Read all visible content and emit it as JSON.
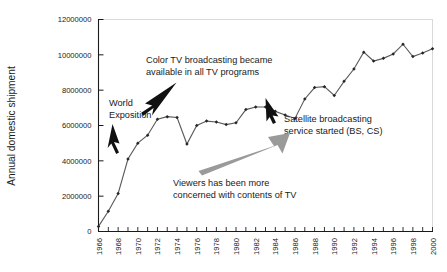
{
  "chart_data": {
    "type": "line",
    "title": "",
    "subtitle": "",
    "xlabel": "",
    "ylabel": "Annual domestic shipment",
    "xlim": [
      1966,
      2000
    ],
    "ylim": [
      0,
      12000000
    ],
    "grid": false,
    "legend": "none",
    "y_ticks": [
      "0",
      "2000000",
      "4000000",
      "6000000",
      "8000000",
      "10000000",
      "12000000"
    ],
    "y_tick_values": [
      0,
      2000000,
      4000000,
      6000000,
      8000000,
      10000000,
      12000000
    ],
    "x_ticks": [
      "1966",
      "1968",
      "1970",
      "1972",
      "1974",
      "1976",
      "1978",
      "1980",
      "1982",
      "1984",
      "1986",
      "1988",
      "1990",
      "1992",
      "1994",
      "1996",
      "1998",
      "2000"
    ],
    "x_tick_values": [
      1966,
      1968,
      1970,
      1972,
      1974,
      1976,
      1978,
      1980,
      1982,
      1984,
      1986,
      1988,
      1990,
      1992,
      1994,
      1996,
      1998,
      2000
    ],
    "x": [
      1966,
      1967,
      1968,
      1969,
      1970,
      1971,
      1972,
      1973,
      1974,
      1975,
      1976,
      1977,
      1978,
      1979,
      1980,
      1981,
      1982,
      1983,
      1984,
      1985,
      1986,
      1987,
      1988,
      1989,
      1990,
      1991,
      1992,
      1993,
      1994,
      1995,
      1996,
      1997,
      1998,
      1999,
      2000
    ],
    "values": [
      290000,
      1150000,
      2150000,
      4100000,
      5000000,
      5450000,
      6350000,
      6500000,
      6450000,
      4950000,
      6000000,
      6250000,
      6200000,
      6050000,
      6150000,
      6900000,
      7050000,
      7050000,
      6800000,
      6600000,
      6400000,
      7500000,
      8150000,
      8200000,
      7700000,
      8500000,
      9200000,
      10150000,
      9650000,
      9800000,
      10050000,
      10600000,
      9900000,
      10100000,
      10350000
    ],
    "series": [
      {
        "name": "Annual domestic shipment",
        "marker": "filled-diamond",
        "color": "#5a5a5a",
        "values": [
          290000,
          1150000,
          2150000,
          4100000,
          5000000,
          5450000,
          6350000,
          6500000,
          6450000,
          4950000,
          6000000,
          6250000,
          6200000,
          6050000,
          6150000,
          6900000,
          7050000,
          7050000,
          6800000,
          6600000,
          6400000,
          7500000,
          8150000,
          8200000,
          7700000,
          8500000,
          9200000,
          10150000,
          9650000,
          9800000,
          10050000,
          10600000,
          9900000,
          10100000,
          10350000
        ]
      }
    ],
    "annotations": [
      {
        "id": "world-exposition",
        "text_lines": [
          "World",
          "Exposition"
        ],
        "arrow": "black",
        "points_to_year": 1970,
        "points_to_value": 5000000
      },
      {
        "id": "color-tv",
        "text_lines": [
          "Color TV broadcasting became",
          "available in all TV programs"
        ],
        "arrow": "black",
        "points_to_year": 1973,
        "points_to_value": 6500000
      },
      {
        "id": "satellite",
        "text_lines": [
          "Satellite broadcasting",
          "service started (BS, CS)"
        ],
        "arrow": "black",
        "points_to_year": 1985,
        "points_to_value": 6600000
      },
      {
        "id": "viewers",
        "text_lines": [
          "Viewers has been more",
          "concerned with contents of TV"
        ],
        "arrow": "gray-thick",
        "points_to_year": 1984,
        "points_to_value": 6900000
      }
    ]
  },
  "colors": {
    "line": "#5a5a5a",
    "marker": "#262626",
    "axis": "#1a1a1a",
    "frame": "#d9d9d9",
    "gray_arrow": "#9a9a9a",
    "background": "#ffffff"
  }
}
